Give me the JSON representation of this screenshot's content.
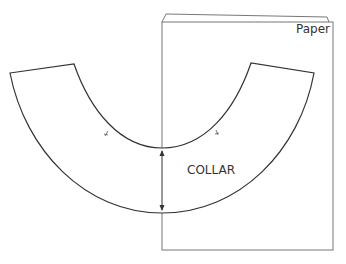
{
  "diagram": {
    "type": "sewing-pattern",
    "labels": {
      "paper": "Paper",
      "collar": "COLLAR"
    },
    "elements": [
      {
        "name": "paper-sheet",
        "shape": "rectangle",
        "stacked_sheets": 2
      },
      {
        "name": "collar-piece",
        "shape": "curved band (half-ring)",
        "notches": 2
      },
      {
        "name": "width-arrow",
        "shape": "double-headed vertical arrow"
      }
    ],
    "colors": {
      "line": "#333333",
      "paper_line": "#777777",
      "background": "#ffffff"
    }
  }
}
